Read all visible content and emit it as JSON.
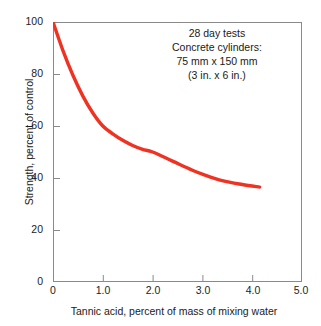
{
  "chart_data": {
    "type": "line",
    "title": "",
    "xlabel": "Tannic acid, percent of mass of mixing water",
    "ylabel": "Strength, percent of control",
    "xlim": [
      0,
      5.0
    ],
    "ylim": [
      0,
      100
    ],
    "grid": false,
    "legend": null,
    "line_color": "#ee3322",
    "xticks": [
      "0",
      "1.0",
      "2.0",
      "3.0",
      "4.0",
      "5.0"
    ],
    "xtick_values": [
      0,
      1.0,
      2.0,
      3.0,
      4.0,
      5.0
    ],
    "yticks": [
      "0",
      "20",
      "40",
      "60",
      "80",
      "100"
    ],
    "ytick_values": [
      0,
      20,
      40,
      60,
      80,
      100
    ],
    "series": [
      {
        "name": "Strength vs tannic acid",
        "x": [
          0.0,
          0.2,
          0.4,
          0.6,
          0.8,
          1.0,
          1.2,
          1.4,
          1.6,
          1.8,
          2.0,
          2.4,
          2.8,
          3.0,
          3.4,
          3.8,
          4.15
        ],
        "values": [
          100.0,
          89.0,
          79.5,
          71.5,
          65.0,
          60.0,
          57.0,
          54.5,
          52.5,
          51.0,
          50.0,
          46.5,
          43.0,
          41.5,
          39.0,
          37.5,
          36.5
        ]
      }
    ],
    "annotations": [
      "28 day tests",
      "Concrete cylinders:",
      "75 mm x 150 mm",
      "(3 in. x 6 in.)"
    ]
  },
  "axes": {
    "x_title": "Tannic acid, percent of mass of mixing water",
    "y_title": "Strength, percent of control",
    "x_ticks": [
      "0",
      "1.0",
      "2.0",
      "3.0",
      "4.0",
      "5.0"
    ],
    "y_ticks": [
      "100",
      "80",
      "60",
      "40",
      "20",
      "0"
    ]
  },
  "annotation": {
    "line1": "28 day tests",
    "line2": "Concrete cylinders:",
    "line3": "75 mm x 150 mm",
    "line4": "(3 in. x 6 in.)"
  },
  "colors": {
    "curve": "#ee3322",
    "frame": "#8a8a8a",
    "text": "#1a1a1a",
    "background": "#ffffff"
  }
}
